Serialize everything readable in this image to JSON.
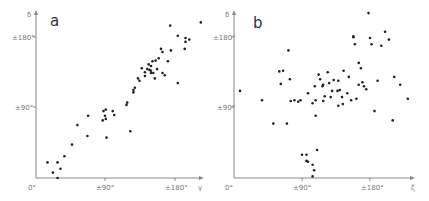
{
  "panels": [
    {
      "label": "a",
      "xaxis_var": "γ",
      "yaxis_var": "δ",
      "x_ticks": [
        "0°",
        "±90°",
        "±180°"
      ],
      "y_ticks": [
        "±90°",
        "±180°"
      ]
    },
    {
      "label": "b",
      "xaxis_var": "ζ",
      "yaxis_var": "δ",
      "x_ticks": [
        "0°",
        "±90°",
        "±180°"
      ],
      "y_ticks": [
        "±90°",
        "±180°"
      ]
    }
  ],
  "chart_data": [
    {
      "type": "scatter",
      "title": "a",
      "xlabel": "γ",
      "ylabel": "δ",
      "xlim": [
        0,
        215
      ],
      "ylim": [
        0,
        215
      ],
      "x_tick_labels": [
        "0°",
        "±90°",
        "±180°"
      ],
      "y_tick_labels": [
        "±90°",
        "±180°"
      ],
      "grid": false,
      "points": [
        [
          15,
          20
        ],
        [
          28,
          20
        ],
        [
          22,
          7
        ],
        [
          32,
          12
        ],
        [
          28,
          0
        ],
        [
          37,
          28
        ],
        [
          47,
          43
        ],
        [
          54,
          68
        ],
        [
          67,
          54
        ],
        [
          68,
          80
        ],
        [
          88,
          86
        ],
        [
          90,
          80
        ],
        [
          91,
          88
        ],
        [
          91,
          76
        ],
        [
          87,
          74
        ],
        [
          100,
          86
        ],
        [
          102,
          81
        ],
        [
          123,
          60
        ],
        [
          92,
          52
        ],
        [
          118,
          94
        ],
        [
          119,
          97
        ],
        [
          127,
          110
        ],
        [
          127,
          113
        ],
        [
          129,
          116
        ],
        [
          133,
          128
        ],
        [
          135,
          125
        ],
        [
          142,
          131
        ],
        [
          138,
          141
        ],
        [
          142,
          136
        ],
        [
          145,
          140
        ],
        [
          148,
          139
        ],
        [
          150,
          144
        ],
        [
          150,
          138
        ],
        [
          153,
          135
        ],
        [
          155,
          128
        ],
        [
          158,
          140
        ],
        [
          147,
          146
        ],
        [
          152,
          150
        ],
        [
          156,
          151
        ],
        [
          160,
          154
        ],
        [
          165,
          162
        ],
        [
          163,
          166
        ],
        [
          150,
          135
        ],
        [
          165,
          135
        ],
        [
          168,
          132
        ],
        [
          172,
          150
        ],
        [
          185,
          122
        ],
        [
          176,
          164
        ],
        [
          185,
          183
        ],
        [
          194,
          166
        ],
        [
          195,
          175
        ],
        [
          195,
          180
        ],
        [
          200,
          178
        ],
        [
          175,
          196
        ],
        [
          215,
          200
        ]
      ]
    },
    {
      "type": "scatter",
      "title": "b",
      "xlabel": "ζ",
      "ylabel": "δ",
      "xlim": [
        0,
        230
      ],
      "ylim": [
        0,
        215
      ],
      "x_tick_labels": [
        "0°",
        "±90°",
        "±180°"
      ],
      "y_tick_labels": [
        "±90°",
        "±180°"
      ],
      "grid": false,
      "points": [
        [
          8,
          112
        ],
        [
          37,
          100
        ],
        [
          52,
          70
        ],
        [
          60,
          137
        ],
        [
          62,
          121
        ],
        [
          65,
          138
        ],
        [
          70,
          70
        ],
        [
          72,
          164
        ],
        [
          74,
          127
        ],
        [
          75,
          99
        ],
        [
          80,
          100
        ],
        [
          85,
          98
        ],
        [
          88,
          100
        ],
        [
          90,
          30
        ],
        [
          96,
          30
        ],
        [
          96,
          22
        ],
        [
          98,
          21
        ],
        [
          98,
          109
        ],
        [
          104,
          17
        ],
        [
          104,
          2
        ],
        [
          104,
          96
        ],
        [
          106,
          10
        ],
        [
          107,
          118
        ],
        [
          108,
          100
        ],
        [
          108,
          80
        ],
        [
          110,
          36
        ],
        [
          112,
          133
        ],
        [
          114,
          127
        ],
        [
          117,
          118
        ],
        [
          118,
          120
        ],
        [
          118,
          99
        ],
        [
          120,
          105
        ],
        [
          124,
          136
        ],
        [
          126,
          122
        ],
        [
          128,
          104
        ],
        [
          130,
          112
        ],
        [
          132,
          126
        ],
        [
          137,
          112
        ],
        [
          138,
          125
        ],
        [
          138,
          93
        ],
        [
          140,
          113
        ],
        [
          143,
          104
        ],
        [
          144,
          95
        ],
        [
          145,
          138
        ],
        [
          150,
          109
        ],
        [
          152,
          130
        ],
        [
          155,
          100
        ],
        [
          158,
          181
        ],
        [
          158,
          182
        ],
        [
          160,
          172
        ],
        [
          162,
          102
        ],
        [
          165,
          120
        ],
        [
          165,
          148
        ],
        [
          168,
          141
        ],
        [
          170,
          123
        ],
        [
          172,
          118
        ],
        [
          175,
          114
        ],
        [
          178,
          212
        ],
        [
          180,
          180
        ],
        [
          182,
          172
        ],
        [
          186,
          86
        ],
        [
          190,
          125
        ],
        [
          195,
          170
        ],
        [
          200,
          188
        ],
        [
          205,
          178
        ],
        [
          210,
          74
        ],
        [
          212,
          130
        ],
        [
          220,
          120
        ],
        [
          230,
          102
        ]
      ]
    }
  ]
}
